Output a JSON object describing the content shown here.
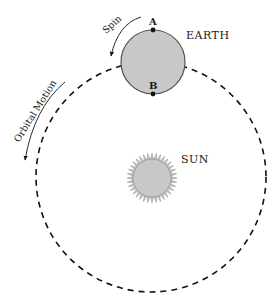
{
  "diagram": {
    "labels": {
      "earth": "EARTH",
      "sun": "SUN",
      "point_a": "A",
      "point_b": "B",
      "spin": "Spin",
      "orbital_motion": "Orbital Motion"
    },
    "colors": {
      "body_fill": "#c8c8c8",
      "outline": "#555555",
      "line": "#111111",
      "background": "#ffffff"
    },
    "sun_ray_count": 36
  }
}
